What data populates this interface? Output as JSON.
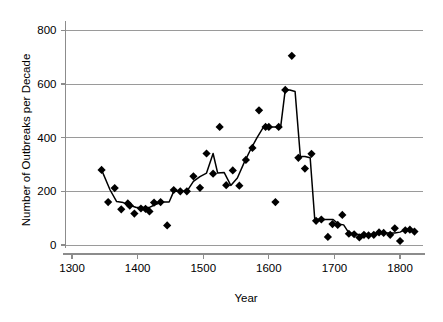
{
  "chart_data": {
    "type": "scatter",
    "title": "",
    "xlabel": "Year",
    "ylabel": "Number of Outbreaks per Decade",
    "xlim": [
      1290,
      1835
    ],
    "ylim": [
      0,
      820
    ],
    "xticks": [
      1300,
      1400,
      1500,
      1600,
      1700,
      1800
    ],
    "xticklabels": [
      "1300",
      "1400",
      "1500",
      "1600",
      "1700",
      "1800"
    ],
    "yticks": [
      0,
      200,
      400,
      600,
      800
    ],
    "yticklabels": [
      "0",
      "200",
      "400",
      "600",
      "800"
    ],
    "grid": "horizontal",
    "legend": "none",
    "marker": "diamond",
    "marker_color": "#000000",
    "line_color": "#000000",
    "series": [
      {
        "name": "Outbreaks per decade (points)",
        "marker_only": true,
        "x": [
          1345,
          1355,
          1365,
          1375,
          1385,
          1388,
          1395,
          1405,
          1412,
          1418,
          1425,
          1435,
          1445,
          1455,
          1465,
          1475,
          1485,
          1495,
          1505,
          1515,
          1525,
          1535,
          1545,
          1555,
          1565,
          1575,
          1585,
          1595,
          1600,
          1610,
          1615,
          1625,
          1635,
          1645,
          1655,
          1665,
          1672,
          1680,
          1690,
          1697,
          1705,
          1712,
          1722,
          1730,
          1738,
          1745,
          1752,
          1760,
          1768,
          1775,
          1785,
          1792,
          1800,
          1808,
          1815,
          1822
        ],
        "y": [
          280,
          160,
          212,
          133,
          155,
          147,
          117,
          136,
          135,
          125,
          158,
          160,
          73,
          205,
          200,
          200,
          256,
          213,
          341,
          266,
          440,
          223,
          278,
          221,
          317,
          362,
          502,
          440,
          440,
          160,
          440,
          578,
          705,
          325,
          285,
          340,
          90,
          95,
          30,
          78,
          75,
          112,
          42,
          40,
          28,
          38,
          36,
          38,
          47,
          45,
          38,
          62,
          15,
          55,
          57,
          50
        ]
      },
      {
        "name": "Smoothed trend (line)",
        "line_only": true,
        "x": [
          1345,
          1358,
          1368,
          1378,
          1388,
          1398,
          1408,
          1418,
          1428,
          1438,
          1448,
          1455,
          1465,
          1475,
          1485,
          1495,
          1505,
          1515,
          1522,
          1532,
          1542,
          1552,
          1562,
          1572,
          1582,
          1592,
          1600,
          1608,
          1618,
          1625,
          1632,
          1640,
          1648,
          1655,
          1663,
          1670,
          1678,
          1688,
          1698,
          1706,
          1714,
          1722,
          1732,
          1742,
          1752,
          1762,
          1772,
          1782,
          1792,
          1800,
          1810,
          1822
        ],
        "y": [
          280,
          205,
          162,
          158,
          148,
          140,
          140,
          140,
          152,
          160,
          160,
          200,
          200,
          200,
          237,
          255,
          268,
          341,
          268,
          270,
          222,
          250,
          305,
          355,
          400,
          440,
          440,
          440,
          440,
          578,
          578,
          572,
          330,
          330,
          325,
          95,
          95,
          95,
          95,
          78,
          75,
          45,
          40,
          38,
          38,
          40,
          45,
          45,
          45,
          48,
          60,
          50
        ]
      }
    ]
  },
  "axes": {
    "x_title": "Year",
    "y_title": "Number of Outbreaks per Decade"
  }
}
